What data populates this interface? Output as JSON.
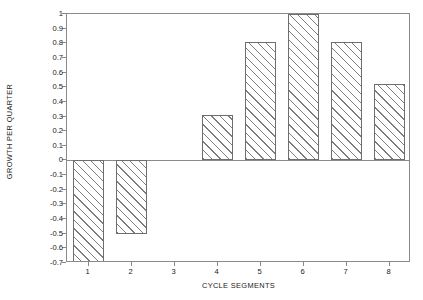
{
  "chart_data": {
    "type": "bar",
    "title": "",
    "subtitle": "",
    "xlabel": "CYCLE SEGMENTS",
    "ylabel": "GROWTH PER QUARTER",
    "categories": [
      "1",
      "2",
      "3",
      "4",
      "5",
      "6",
      "7",
      "8"
    ],
    "values": [
      -0.72,
      -0.5,
      0,
      0.31,
      0.81,
      1.0,
      0.81,
      0.52
    ],
    "series": [
      {
        "name": "Growth per quarter",
        "values": [
          -0.72,
          -0.5,
          0,
          0.31,
          0.81,
          1.0,
          0.81,
          0.52
        ]
      }
    ],
    "ylim": [
      -0.7,
      1.0
    ],
    "xlim": [
      0.5,
      8.5
    ],
    "ytick_labels": [
      "1",
      "0.9",
      "0.8",
      "0.7",
      "0.6",
      "0.5",
      "0.4",
      "0.3",
      "0.2",
      "0.1",
      "0",
      "-0.1",
      "-0.2",
      "-0.3",
      "-0.4",
      "-0.5",
      "-0.6",
      "-0.7"
    ],
    "ytick_values": [
      1,
      0.9,
      0.8,
      0.7,
      0.6,
      0.5,
      0.4,
      0.3,
      0.2,
      0.1,
      0,
      -0.1,
      -0.2,
      -0.3,
      -0.4,
      -0.5,
      -0.6,
      -0.7
    ],
    "xtick_labels": [
      "1",
      "2",
      "3",
      "4",
      "5",
      "6",
      "7",
      "8"
    ],
    "grid": false,
    "legend": "none",
    "bar_fill": "diagonal-hatch",
    "bar_edge_color": "#6e6e6e",
    "hatch_color": "#7d7d7d",
    "axis_color": "#8a8a8a",
    "background": "#ffffff"
  }
}
